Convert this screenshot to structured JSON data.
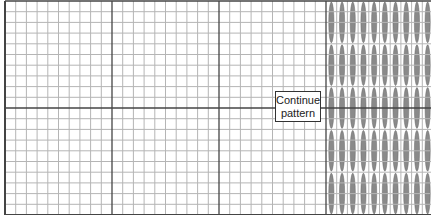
{
  "diagram": {
    "grid": {
      "cell_size": 10.7,
      "origin_x": 5,
      "origin_y": 1,
      "cols": 40,
      "rows": 20,
      "heavy_every": 10,
      "light_color": "#b5b5b5",
      "heavy_color": "#444444"
    },
    "stitch_area": {
      "start_col": 30,
      "stitch_rows": 5,
      "cells_per_stitch_row": 4,
      "fill_color": "#8a8a8a",
      "stroke_color": "#6a6a6a"
    },
    "label": {
      "line1": "Continue",
      "line2": "pattern"
    }
  }
}
